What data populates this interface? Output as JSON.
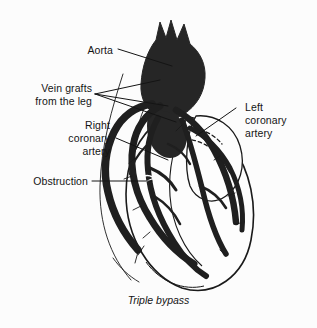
{
  "figure": {
    "title": "Triple bypass",
    "caption": "Triple bypass",
    "background_color": "#fcfcfc",
    "ink_color": "#141414",
    "fill_color": "#262626"
  },
  "labels": {
    "aorta": "Aorta",
    "vein_grafts_line1": "Vein grafts",
    "vein_grafts_line2": "from the leg",
    "right_coronary_line1": "Right",
    "right_coronary_line2": "coronary",
    "right_coronary_line3": "artery",
    "obstruction": "Obstruction",
    "left_coronary_line1": "Left",
    "left_coronary_line2": "coronary",
    "left_coronary_line3": "artery"
  },
  "parts": [
    {
      "name": "aorta",
      "label": "Aorta"
    },
    {
      "name": "vein-grafts",
      "label": "Vein grafts from the leg",
      "count": 3
    },
    {
      "name": "right-coronary-artery",
      "label": "Right coronary artery"
    },
    {
      "name": "obstruction",
      "label": "Obstruction"
    },
    {
      "name": "left-coronary-artery",
      "label": "Left coronary artery"
    }
  ]
}
